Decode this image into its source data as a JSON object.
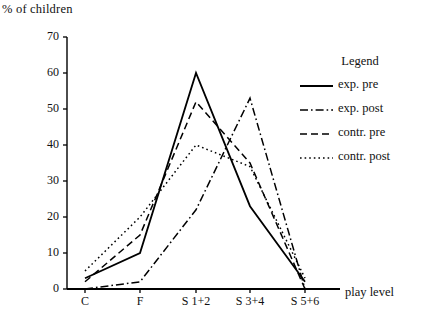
{
  "chart_data": {
    "type": "line",
    "title": "",
    "ylabel": "% of children",
    "xlabel": "play level",
    "categories": [
      "C",
      "F",
      "S 1+2",
      "S 3+4",
      "S 5+6"
    ],
    "ylim": [
      0,
      70
    ],
    "yticks": [
      0,
      10,
      20,
      30,
      40,
      50,
      60,
      70
    ],
    "ytick_labels": [
      "0",
      "10",
      "20",
      "30",
      "40",
      "50",
      "60",
      "70"
    ],
    "grid": false,
    "legend_position": "right",
    "legend_title": "Legend",
    "series": [
      {
        "name": "exp. pre",
        "style": "solid",
        "color": "#000000",
        "values": [
          3,
          10,
          60,
          23,
          2
        ]
      },
      {
        "name": "exp. post",
        "style": "dash-dot",
        "color": "#000000",
        "values": [
          0,
          2,
          22,
          53,
          0
        ]
      },
      {
        "name": "contr. pre",
        "style": "dashed",
        "color": "#000000",
        "values": [
          2,
          15,
          52,
          35,
          0
        ]
      },
      {
        "name": "contr. post",
        "style": "dotted",
        "color": "#000000",
        "values": [
          5,
          20,
          40,
          34,
          3
        ]
      }
    ]
  },
  "axis": {
    "y_title": "% of children",
    "x_title": "play level"
  },
  "legend": {
    "title": "Legend",
    "entries": [
      {
        "label": "exp. pre"
      },
      {
        "label": "exp. post"
      },
      {
        "label": "contr. pre"
      },
      {
        "label": "contr. post"
      }
    ]
  }
}
